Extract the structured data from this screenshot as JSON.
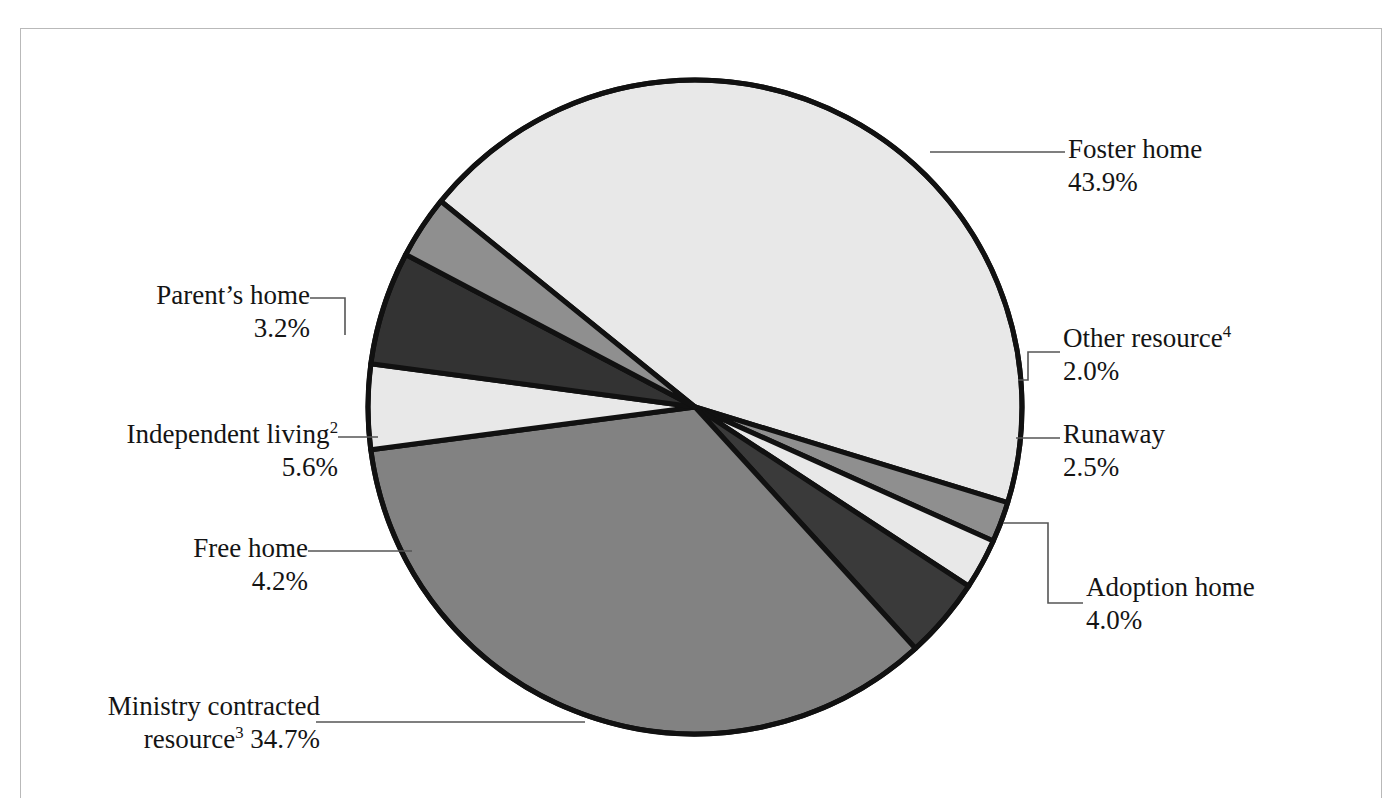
{
  "figure": {
    "frame_color": "#b9b9b9",
    "background": "#ffffff",
    "top_partial_text": ""
  },
  "chart_data": {
    "type": "pie",
    "title": "",
    "subtitle": "",
    "xlabel": "",
    "ylabel": "",
    "legend_position": "callout-labels",
    "grid": false,
    "units": "percent",
    "total": 100.1,
    "categories": [
      "Foster home",
      "Other resource4",
      "Runaway",
      "Adoption home",
      "Ministry contracted resource3",
      "Free home",
      "Independent living2",
      "Parent's home"
    ],
    "values": [
      43.9,
      2.0,
      2.5,
      4.0,
      34.7,
      4.2,
      5.6,
      3.2
    ],
    "colors": [
      "#e8e8e8",
      "#8f8f8f",
      "#e8e8e8",
      "#3a3a3a",
      "#828282",
      "#e8e8e8",
      "#333333",
      "#8f8f8f"
    ],
    "slices": [
      {
        "id": "foster-home",
        "label": "Foster home",
        "footnote": "",
        "value": 43.9,
        "value_text": "43.9%",
        "color": "#e8e8e8",
        "start_deg": -17.0,
        "end_deg": 141.0
      },
      {
        "id": "other-resource",
        "label": "Other resource",
        "footnote": "4",
        "value": 2.0,
        "value_text": "2.0%",
        "color": "#8f8f8f",
        "start_deg": -24.2,
        "end_deg": -17.0
      },
      {
        "id": "runaway",
        "label": "Runaway",
        "footnote": "",
        "value": 2.5,
        "value_text": "2.5%",
        "color": "#e8e8e8",
        "start_deg": -33.2,
        "end_deg": -24.2
      },
      {
        "id": "adoption-home",
        "label": "Adoption home",
        "footnote": "",
        "value": 4.0,
        "value_text": "4.0%",
        "color": "#3a3a3a",
        "start_deg": -47.6,
        "end_deg": -33.2
      },
      {
        "id": "ministry-contracted-resource",
        "label": "Ministry contracted resource",
        "footnote": "3",
        "value": 34.7,
        "value_text": "34.7%",
        "color": "#828282",
        "start_deg": -172.5,
        "end_deg": -47.6
      },
      {
        "id": "free-home",
        "label": "Free home",
        "footnote": "",
        "value": 4.2,
        "value_text": "4.2%",
        "color": "#e8e8e8",
        "start_deg": -187.6,
        "end_deg": -172.5
      },
      {
        "id": "independent-living",
        "label": "Independent living",
        "footnote": "2",
        "value": 5.6,
        "value_text": "5.6%",
        "color": "#333333",
        "start_deg": 152.2,
        "end_deg": 172.4
      },
      {
        "id": "parents-home",
        "label": "Parent's home",
        "footnote": "",
        "value": 3.2,
        "value_text": "3.2%",
        "color": "#8f8f8f",
        "start_deg": 141.0,
        "end_deg": 152.2
      }
    ],
    "geometry": {
      "center_x": 695,
      "center_y": 407,
      "radius": 327,
      "outline_color": "#111111",
      "outline_width": 5
    }
  },
  "labels": {
    "foster_home": {
      "name": "Foster home",
      "percent": "43.9%"
    },
    "other_resource": {
      "name": "Other resource",
      "footnote": "4",
      "percent": "2.0%"
    },
    "runaway": {
      "name": "Runaway",
      "percent": "2.5%"
    },
    "adoption_home": {
      "name": "Adoption home",
      "percent": "4.0%"
    },
    "ministry_contracted": {
      "line1": "Ministry contracted",
      "line2_prefix": "resource",
      "footnote": "3",
      "line2_percent": " 34.7%"
    },
    "free_home": {
      "name": "Free home",
      "percent": "4.2%"
    },
    "independent_living": {
      "name": "Independent living",
      "footnote": "2",
      "percent": "5.6%"
    },
    "parents_home": {
      "name": "Parent’s home",
      "percent": "3.2%"
    }
  }
}
